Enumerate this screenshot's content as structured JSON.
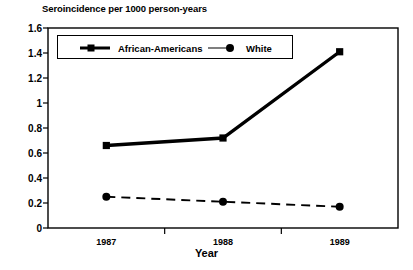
{
  "chart_data": {
    "type": "line",
    "title": "Seroincidence per 1000 person-years",
    "xlabel": "Year",
    "ylabel": "",
    "categories": [
      "1987",
      "1988",
      "1989"
    ],
    "series": [
      {
        "name": "African-Americans",
        "values": [
          0.66,
          0.72,
          1.41
        ],
        "marker": "square",
        "linestyle": "solid",
        "linewidth": "thick",
        "color": "#000000"
      },
      {
        "name": "White",
        "values": [
          0.25,
          0.21,
          0.17
        ],
        "marker": "circle",
        "linestyle": "dashed",
        "linewidth": "thin",
        "color": "#000000"
      }
    ],
    "ylim": [
      0,
      1.6
    ],
    "yticks": [
      "0",
      "0.2",
      "0.4",
      "0.6",
      "0.8",
      "1",
      "1.2",
      "1.4",
      "1.6"
    ],
    "ytick_values": [
      0,
      0.2,
      0.4,
      0.6,
      0.8,
      1,
      1.2,
      1.4,
      1.6
    ],
    "grid": false,
    "legend_position": "top-left-inside",
    "frame": "box"
  },
  "colors": {
    "ink": "#000000",
    "background": "#ffffff"
  }
}
